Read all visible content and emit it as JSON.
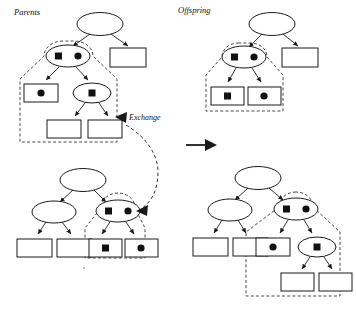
{
  "figure": {
    "type": "genetic-programming-crossover-diagram",
    "labels": {
      "parents": "Parents",
      "offspring": "Offspring",
      "exchange": "Exchange"
    },
    "colors": {
      "stroke": "#1a1a1a",
      "fill": "#ffffff",
      "marker": "#111111",
      "dashed": "#333333",
      "background": "#ffffff"
    },
    "markers": {
      "square": "filled-square-marker",
      "circle": "filled-circle-marker",
      "none": "empty-node"
    },
    "panels": [
      {
        "name": "parent-tree-1",
        "position": "top-left",
        "selected_subtree": true,
        "nodes": [
          {
            "id": "p1-root",
            "shape": "ellipse",
            "marker": "none",
            "selected": false
          },
          {
            "id": "p1-n1",
            "shape": "ellipse",
            "marker": "square-circle",
            "selected": true
          },
          {
            "id": "p1-n2",
            "shape": "rect",
            "marker": "none",
            "selected": false
          },
          {
            "id": "p1-n3",
            "shape": "rect",
            "marker": "circle",
            "selected": true
          },
          {
            "id": "p1-n4",
            "shape": "ellipse",
            "marker": "square",
            "selected": true
          },
          {
            "id": "p1-n5",
            "shape": "rect",
            "marker": "none",
            "selected": true
          },
          {
            "id": "p1-n6",
            "shape": "rect",
            "marker": "none",
            "selected": true
          }
        ]
      },
      {
        "name": "parent-tree-2",
        "position": "bottom-left",
        "selected_subtree": true,
        "nodes": [
          {
            "id": "p2-root",
            "shape": "ellipse",
            "marker": "none",
            "selected": false
          },
          {
            "id": "p2-n1",
            "shape": "ellipse",
            "marker": "none",
            "selected": false
          },
          {
            "id": "p2-n2",
            "shape": "ellipse",
            "marker": "square-circle",
            "selected": true
          },
          {
            "id": "p2-n3",
            "shape": "rect",
            "marker": "none",
            "selected": false
          },
          {
            "id": "p2-n4",
            "shape": "rect",
            "marker": "none",
            "selected": false
          },
          {
            "id": "p2-n5",
            "shape": "rect",
            "marker": "square",
            "selected": true
          },
          {
            "id": "p2-n6",
            "shape": "rect",
            "marker": "circle",
            "selected": true
          }
        ]
      },
      {
        "name": "offspring-tree-1",
        "position": "top-right",
        "selected_subtree": true,
        "nodes": [
          {
            "id": "o1-root",
            "shape": "ellipse",
            "marker": "none",
            "selected": false
          },
          {
            "id": "o1-n1",
            "shape": "ellipse",
            "marker": "square-circle",
            "selected": true
          },
          {
            "id": "o1-n2",
            "shape": "rect",
            "marker": "none",
            "selected": false
          },
          {
            "id": "o1-n3",
            "shape": "rect",
            "marker": "square",
            "selected": true
          },
          {
            "id": "o1-n4",
            "shape": "rect",
            "marker": "circle",
            "selected": true
          }
        ]
      },
      {
        "name": "offspring-tree-2",
        "position": "bottom-right",
        "selected_subtree": true,
        "nodes": [
          {
            "id": "o2-root",
            "shape": "ellipse",
            "marker": "none",
            "selected": false
          },
          {
            "id": "o2-n1",
            "shape": "ellipse",
            "marker": "none",
            "selected": false
          },
          {
            "id": "o2-n2",
            "shape": "ellipse",
            "marker": "square-circle",
            "selected": true
          },
          {
            "id": "o2-n3",
            "shape": "rect",
            "marker": "none",
            "selected": false
          },
          {
            "id": "o2-n4",
            "shape": "rect",
            "marker": "none",
            "selected": false
          },
          {
            "id": "o2-n5",
            "shape": "rect",
            "marker": "circle",
            "selected": true
          },
          {
            "id": "o2-n6",
            "shape": "ellipse",
            "marker": "square",
            "selected": true
          },
          {
            "id": "o2-n7",
            "shape": "rect",
            "marker": "none",
            "selected": true
          },
          {
            "id": "o2-n8",
            "shape": "rect",
            "marker": "none",
            "selected": true
          }
        ]
      }
    ],
    "connectors": [
      {
        "name": "exchange-arrow",
        "style": "dashed-curved",
        "arrowheads": 2
      },
      {
        "name": "transform-arrow",
        "style": "solid-block",
        "direction": "right"
      }
    ]
  }
}
